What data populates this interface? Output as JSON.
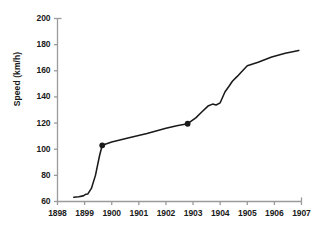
{
  "chart_data": {
    "type": "line",
    "title": "",
    "xlabel": "",
    "ylabel": "Speed (km/h)",
    "xlim": [
      1898,
      1907
    ],
    "ylim": [
      60,
      200
    ],
    "grid": false,
    "legend": "none",
    "xticks": [
      "1898",
      "1899",
      "1900",
      "1901",
      "1902",
      "1903",
      "1904",
      "1905",
      "1906",
      "1907"
    ],
    "yticks": [
      "60",
      "80",
      "100",
      "120",
      "140",
      "160",
      "180",
      "200"
    ],
    "line_color": "#1a1a1a",
    "axis_color": "#9a9a9a",
    "series": [
      {
        "name": "Land speed record",
        "x": [
          1898.6,
          1898.78,
          1898.95,
          1899.05,
          1899.12,
          1899.25,
          1899.4,
          1899.55,
          1899.65,
          1900.0,
          1900.6,
          1901.3,
          1902.0,
          1902.4,
          1902.8,
          1903.1,
          1903.35,
          1903.55,
          1903.72,
          1903.85,
          1904.0,
          1904.18,
          1904.32,
          1904.45,
          1904.62,
          1904.8,
          1905.0,
          1905.4,
          1905.9,
          1906.4,
          1906.9
        ],
        "y": [
          63.3,
          63.6,
          64.3,
          65.6,
          65.8,
          70.0,
          80.0,
          95.0,
          103.0,
          105.5,
          108.5,
          112.0,
          116.0,
          118.0,
          119.5,
          124.0,
          129.0,
          133.0,
          134.5,
          133.8,
          135.5,
          144.0,
          148.0,
          152.0,
          155.5,
          159.5,
          163.8,
          166.5,
          170.5,
          173.5,
          175.6
        ]
      }
    ],
    "markers": [
      {
        "x": 1899.65,
        "y": 103.0
      },
      {
        "x": 1902.8,
        "y": 119.5
      }
    ]
  }
}
